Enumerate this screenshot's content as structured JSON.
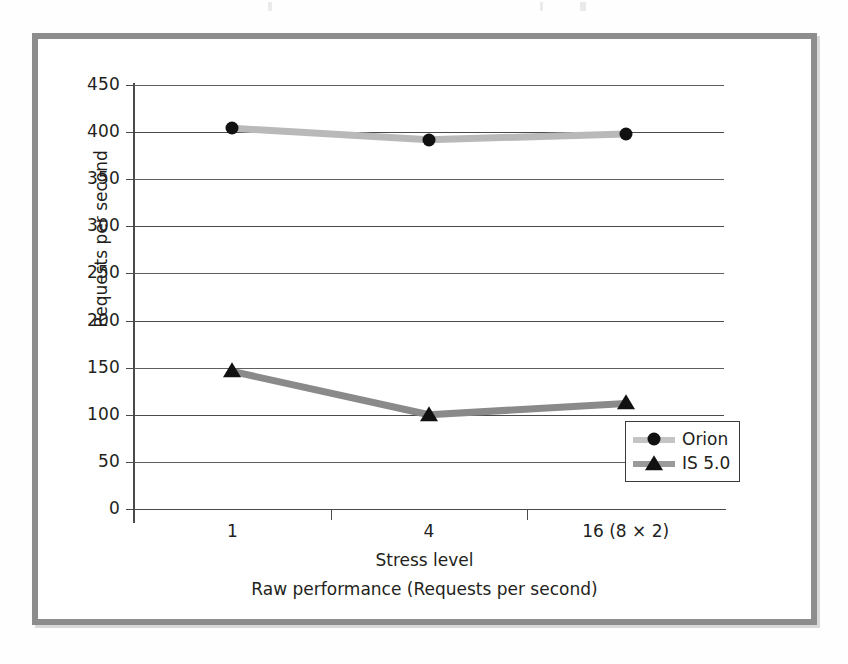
{
  "figure": {
    "caption": "Raw performance (Requests per second)"
  },
  "chart_data": {
    "type": "line",
    "title": "",
    "xlabel": "Stress level",
    "ylabel": "Requests per second",
    "categories": [
      "1",
      "4",
      "16 (8 × 2)"
    ],
    "ylim": [
      0,
      450
    ],
    "yticks": [
      0,
      50,
      100,
      150,
      200,
      250,
      300,
      350,
      400,
      450
    ],
    "ytick_labels": [
      "0",
      "50",
      "100",
      "150",
      "200",
      "250",
      "300",
      "350",
      "400",
      "450"
    ],
    "grid": true,
    "legend_position": "lower right",
    "series": [
      {
        "name": "Orion",
        "marker": "circle",
        "color": "#b9b9b9",
        "marker_color": "#111111",
        "values": [
          404,
          392,
          398
        ]
      },
      {
        "name": "IS 5.0",
        "marker": "triangle",
        "color": "#8a8a8a",
        "marker_color": "#111111",
        "values": [
          146,
          100,
          112
        ]
      }
    ]
  },
  "legend": {
    "items": [
      {
        "label": "Orion",
        "marker": "circle-marker-icon"
      },
      {
        "label": "IS 5.0",
        "marker": "triangle-marker-icon"
      }
    ]
  },
  "colors": {
    "frame": "#8d8d8d",
    "axis": "#4a4a4a",
    "text": "#231f20",
    "orion_line": "#b9b9b9",
    "is50_line": "#8a8a8a",
    "marker": "#111111"
  }
}
